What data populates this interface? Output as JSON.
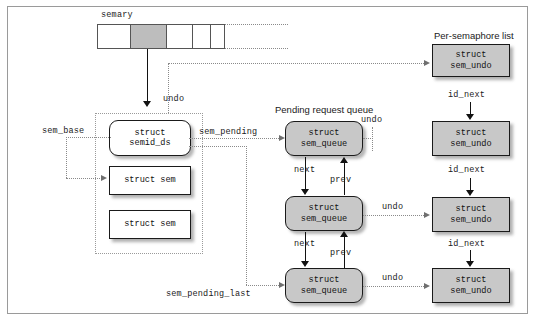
{
  "diagram": {
    "title_labels": {
      "semary": "semary",
      "per_semaphore_list": "Per-semaphore list",
      "pending_request_queue": "Pending request queue"
    },
    "pointer_labels": {
      "undo_from_semary": "undo",
      "sem_base": "sem_base",
      "sem_pending": "sem_pending",
      "sem_pending_last": "sem_pending_last",
      "id_next_1": "id_next",
      "id_next_2": "id_next",
      "id_next_3": "id_next",
      "undo_q1": "undo",
      "undo_q2": "undo",
      "undo_q3": "undo",
      "next_1": "next",
      "prev_1": "prev",
      "next_2": "next",
      "prev_2": "prev"
    },
    "semary_array": {
      "cells": [
        {
          "id": "cell-0",
          "shaded": false
        },
        {
          "id": "cell-1",
          "shaded": true
        },
        {
          "id": "cell-2",
          "shaded": false
        },
        {
          "id": "cell-3",
          "shaded": false
        },
        {
          "id": "cell-4",
          "shaded": false
        }
      ]
    },
    "structs": {
      "semid_ds": {
        "line1": "struct",
        "line2": "semid_ds"
      },
      "sem_1": {
        "line1": "struct sem"
      },
      "sem_2": {
        "line1": "struct sem"
      },
      "sem_queue_1": {
        "line1": "struct",
        "line2": "sem_queue"
      },
      "sem_queue_2": {
        "line1": "struct",
        "line2": "sem_queue"
      },
      "sem_queue_3": {
        "line1": "struct",
        "line2": "sem_queue"
      },
      "sem_undo_1": {
        "line1": "struct",
        "line2": "sem_undo"
      },
      "sem_undo_2": {
        "line1": "struct",
        "line2": "sem_undo"
      },
      "sem_undo_3": {
        "line1": "struct",
        "line2": "sem_undo"
      },
      "sem_undo_4": {
        "line1": "struct",
        "line2": "sem_undo"
      }
    },
    "colors": {
      "shaded_fill": "#c8c8c8",
      "array_shaded_fill": "#bdbdbd",
      "stroke": "#1a1a1a",
      "dotted_stroke": "#8a8a8a",
      "frame": "#9a9a9a",
      "background": "#ffffff"
    }
  }
}
